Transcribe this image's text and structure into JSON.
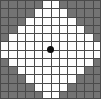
{
  "figure": {
    "name": "diamond-grid-bitmap",
    "type": "raster-grid",
    "width_px": 101,
    "height_px": 99,
    "columns": 12,
    "rows": 12,
    "cell_width_px": 8.42,
    "cell_height_px": 8.25,
    "gridline_color": "#4a4a4a",
    "gridline_width_px": 1,
    "background_color": "#737373",
    "fill_color": "#fdfdfd",
    "marker": {
      "name": "center-dot",
      "color": "#0d0d0d",
      "shape": "circle",
      "center_col": 5.5,
      "center_row": 5.5,
      "center_x_px": 50,
      "center_y_px": 49,
      "diameter_px": 7
    },
    "shape_description": "white diamond (rhombus) of filled cells on a gray 12x12 cell grid with a black dot at the center",
    "row_spans": [
      {
        "row": 0,
        "start_col": 5,
        "end_col": 6
      },
      {
        "row": 1,
        "start_col": 4,
        "end_col": 7
      },
      {
        "row": 2,
        "start_col": 3,
        "end_col": 8
      },
      {
        "row": 3,
        "start_col": 2,
        "end_col": 9
      },
      {
        "row": 4,
        "start_col": 1,
        "end_col": 10
      },
      {
        "row": 5,
        "start_col": 0,
        "end_col": 11
      },
      {
        "row": 6,
        "start_col": 0,
        "end_col": 11
      },
      {
        "row": 7,
        "start_col": 1,
        "end_col": 10
      },
      {
        "row": 8,
        "start_col": 2,
        "end_col": 9
      },
      {
        "row": 9,
        "start_col": 3,
        "end_col": 8
      },
      {
        "row": 10,
        "start_col": 4,
        "end_col": 7
      },
      {
        "row": 11,
        "start_col": 5,
        "end_col": 6
      }
    ]
  }
}
